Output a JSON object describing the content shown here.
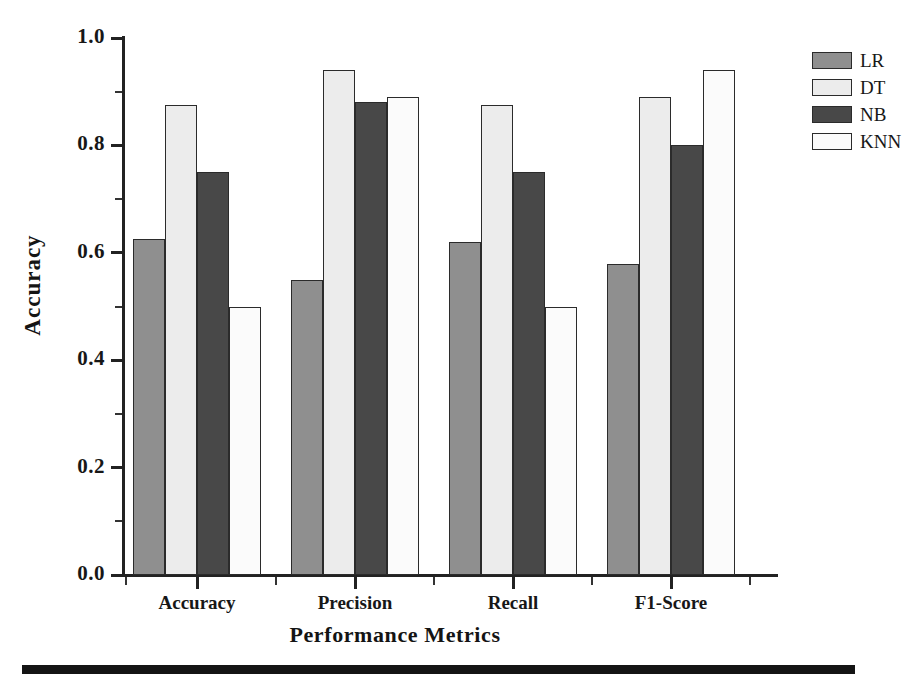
{
  "chart_data": {
    "type": "bar",
    "title": "",
    "xlabel": "Performance Metrics",
    "ylabel": "Accuracy",
    "categories": [
      "Accuracy",
      "Precision",
      "Recall",
      "F1-Score"
    ],
    "series": [
      {
        "name": "LR",
        "color": "#8f8f8f",
        "values": [
          0.625,
          0.55,
          0.62,
          0.58
        ]
      },
      {
        "name": "DT",
        "color": "#ececec",
        "values": [
          0.875,
          0.94,
          0.875,
          0.89
        ]
      },
      {
        "name": "NB",
        "color": "#484848",
        "values": [
          0.75,
          0.88,
          0.75,
          0.8
        ]
      },
      {
        "name": "KNN",
        "color": "#fbfbfb",
        "values": [
          0.5,
          0.89,
          0.5,
          0.94
        ]
      }
    ],
    "ylim": [
      0.0,
      1.0
    ],
    "ytick_labels": [
      "0.0",
      "0.2",
      "0.4",
      "0.6",
      "0.8",
      "1.0"
    ],
    "ytick_values": [
      0.0,
      0.2,
      0.4,
      0.6,
      0.8,
      1.0
    ],
    "yminor_values": [
      0.1,
      0.3,
      0.5,
      0.7,
      0.9
    ],
    "grid": false,
    "legend_position": "outside-right-top",
    "legend_entries": [
      "LR",
      "DT",
      "NB",
      "KNN"
    ]
  },
  "axes": {
    "y_title": "Accuracy",
    "x_title": "Performance Metrics"
  },
  "artifacts": {
    "scan_bar_label": "page-scan-black-bar"
  }
}
